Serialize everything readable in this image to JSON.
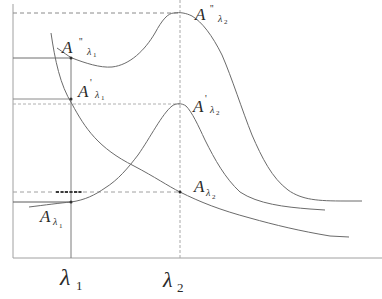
{
  "diagram": {
    "type": "absorbance-vs-wavelength schematic",
    "colors": {
      "curve": "#6b6b6b",
      "axis": "#9a9a9a",
      "guide_solid": "#7a7a7a",
      "guide_dashed": "#9a9a9a",
      "text": "#2a2a2a"
    },
    "x_axis": {
      "ticks": [
        {
          "symbol": "λ",
          "sub": "1"
        },
        {
          "symbol": "λ",
          "sub": "2"
        }
      ]
    },
    "curves": [
      {
        "name": "mixture-curve-double-prime",
        "description": "upper curve with dip near λ1 and peak at λ2"
      },
      {
        "name": "component-curve-prime",
        "description": "lower peaked curve with maximum at λ2"
      },
      {
        "name": "interferent-curve",
        "description": "monotonically decreasing curve"
      }
    ],
    "points": [
      {
        "id": "A''λ1",
        "main": "A",
        "prime": "''",
        "sub": "λ",
        "sub_index": "1"
      },
      {
        "id": "A'λ1",
        "main": "A",
        "prime": "'",
        "sub": "λ",
        "sub_index": "1"
      },
      {
        "id": "Aλ1",
        "main": "A",
        "prime": "",
        "sub": "λ",
        "sub_index": "1"
      },
      {
        "id": "A''λ2",
        "main": "A",
        "prime": "''",
        "sub": "λ",
        "sub_index": "2"
      },
      {
        "id": "A'λ2",
        "main": "A",
        "prime": "'",
        "sub": "λ",
        "sub_index": "2"
      },
      {
        "id": "Aλ2",
        "main": "A",
        "prime": "",
        "sub": "λ",
        "sub_index": "2"
      }
    ]
  }
}
